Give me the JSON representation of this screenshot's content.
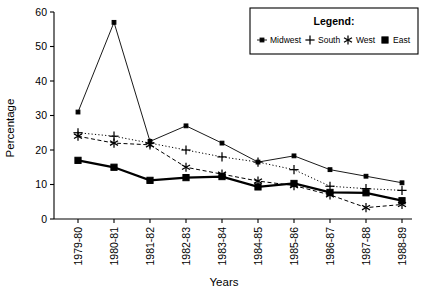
{
  "chart_data": {
    "type": "line",
    "title": "",
    "xlabel": "Years",
    "ylabel": "Percentage",
    "ylim": [
      0,
      60
    ],
    "yticks": [
      0,
      10,
      20,
      30,
      40,
      50,
      60
    ],
    "grid": false,
    "legend_position": "top-right",
    "legend_title": "Legend:",
    "categories": [
      "1979-80",
      "1980-81",
      "1981-82",
      "1982-83",
      "1983-84",
      "1984-85",
      "1985-86",
      "1986-87",
      "1987-88",
      "1988-89"
    ],
    "series": [
      {
        "name": "Midwest",
        "marker": "small-square",
        "line": "solid-thin",
        "values": [
          31,
          57,
          22.5,
          27,
          22,
          16.5,
          18.3,
          14.3,
          12.4,
          10.5
        ]
      },
      {
        "name": "South",
        "marker": "plus",
        "line": "dotted",
        "values": [
          25,
          24,
          22,
          20,
          18,
          16.5,
          14.3,
          9.5,
          8.8,
          8.3
        ]
      },
      {
        "name": "West",
        "marker": "asterisk",
        "line": "dashed",
        "values": [
          24,
          22,
          21.5,
          15,
          13,
          11,
          9.7,
          7,
          3.3,
          4.2
        ]
      },
      {
        "name": "East",
        "marker": "filled-square",
        "line": "solid-bold",
        "values": [
          17,
          15,
          11.2,
          12,
          12.3,
          9.3,
          10.3,
          7.7,
          7.6,
          5.3
        ]
      }
    ]
  },
  "axes": {
    "y_title": "Percentage",
    "x_title": "Years",
    "y_tick_labels": [
      "0",
      "10",
      "20",
      "30",
      "40",
      "50",
      "60"
    ],
    "x_tick_labels": [
      "1979-80",
      "1980-81",
      "1981-82",
      "1982-83",
      "1983-84",
      "1984-85",
      "1985-86",
      "1986-87",
      "1987-88",
      "1988-89"
    ]
  },
  "legend": {
    "title": "Legend:",
    "entries": [
      {
        "label": "Midwest",
        "icon": "line-small-square-marker-icon"
      },
      {
        "label": "South",
        "icon": "plus-marker-icon"
      },
      {
        "label": "West",
        "icon": "asterisk-marker-icon"
      },
      {
        "label": "East",
        "icon": "filled-square-marker-icon"
      }
    ]
  },
  "colors": {
    "ink": "#000000",
    "background": "#ffffff"
  }
}
